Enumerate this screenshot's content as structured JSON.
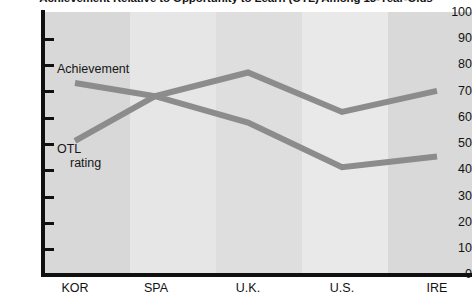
{
  "chart_data": {
    "type": "line",
    "title": "Achievement Relative to Opportunity to Learn (OTL) Among 13-Year-Olds",
    "categories": [
      "KOR",
      "SPA",
      "U.K.",
      "U.S.",
      "IRE"
    ],
    "series": [
      {
        "name": "Achievement",
        "values": [
          73,
          68,
          77,
          62,
          70
        ],
        "color": "#8c8c8c"
      },
      {
        "name": "OTL rating",
        "values": [
          51,
          68,
          58,
          41,
          45
        ],
        "color": "#8c8c8c"
      }
    ],
    "xlabel": "",
    "ylabel": "",
    "ylim": [
      0,
      100
    ],
    "yticks": [
      0,
      10,
      20,
      30,
      40,
      50,
      60,
      70,
      80,
      90,
      100
    ],
    "grid": false,
    "legend": "inline-labels",
    "band_colors": [
      "#d8d8d8",
      "#e6e6e6",
      "#dedede",
      "#e9e9e9",
      "#d9d9d9"
    ],
    "axis_color": "#101010",
    "annotations": [
      {
        "text": "Achievement",
        "series": "Achievement"
      },
      {
        "text": "OTL",
        "series": "OTL rating"
      },
      {
        "text": "rating",
        "series": "OTL rating"
      }
    ]
  },
  "labels": {
    "series_achievement": "Achievement",
    "series_otl_line1": "OTL",
    "series_otl_line2": "rating"
  }
}
